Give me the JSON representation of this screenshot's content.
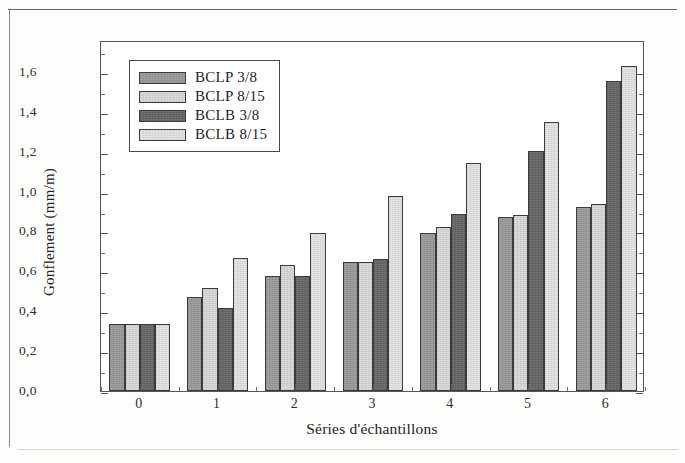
{
  "chart_data": {
    "type": "bar",
    "title": "",
    "xlabel": "Séries d'échantillons",
    "ylabel": "Gonflement (mm/m)",
    "categories": [
      "0",
      "1",
      "2",
      "3",
      "4",
      "5",
      "6"
    ],
    "ylim": [
      0.0,
      1.76
    ],
    "ytick_labels": [
      "0,0",
      "0,2",
      "0,4",
      "0,6",
      "0,8",
      "1,0",
      "1,2",
      "1,4",
      "1,6"
    ],
    "ytick_values": [
      0.0,
      0.2,
      0.4,
      0.6,
      0.8,
      1.0,
      1.2,
      1.4,
      1.6
    ],
    "minor_ticks": true,
    "grid": false,
    "legend_position": "top-left",
    "series": [
      {
        "name": "BCLP 3/8",
        "color": "#9a9a9a",
        "values": [
          0.335,
          0.47,
          0.575,
          0.645,
          0.79,
          0.875,
          0.925
        ]
      },
      {
        "name": "BCLP 8/15",
        "color": "#d9d9d9",
        "values": [
          0.335,
          0.515,
          0.63,
          0.645,
          0.82,
          0.885,
          0.94
        ]
      },
      {
        "name": "BCLB 3/8",
        "color": "#656565",
        "values": [
          0.335,
          0.415,
          0.575,
          0.66,
          0.89,
          1.205,
          1.555
        ]
      },
      {
        "name": "BCLB 8/15",
        "color": "#e4e4e4",
        "values": [
          0.335,
          0.665,
          0.79,
          0.98,
          1.145,
          1.35,
          1.63
        ]
      }
    ]
  }
}
